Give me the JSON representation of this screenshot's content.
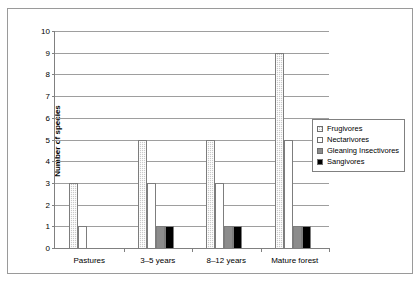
{
  "chart_data": {
    "type": "bar",
    "title": "",
    "xlabel": "",
    "ylabel": "Number of species",
    "ylim": [
      0,
      10
    ],
    "ytick_step": 1,
    "grid": true,
    "legend_position": "right",
    "categories": [
      "Pastures",
      "3–5 years",
      "8–12 years",
      "Mature forest"
    ],
    "yticks": [
      "10",
      "9",
      "8",
      "7",
      "6",
      "5",
      "4",
      "3",
      "2",
      "1",
      "0"
    ],
    "series": [
      {
        "name": "Frugivores",
        "values": [
          3,
          5,
          5,
          9
        ],
        "color": "#c9c9c9",
        "pattern": "hatched"
      },
      {
        "name": "Nectarivores",
        "values": [
          1,
          3,
          3,
          5
        ],
        "color": "#ffffff",
        "pattern": "solid"
      },
      {
        "name": "Gleaning Insectivores",
        "values": [
          0,
          1,
          1,
          1
        ],
        "color": "#8c8c8c",
        "pattern": "solid"
      },
      {
        "name": "Sangivores",
        "values": [
          0,
          1,
          1,
          1
        ],
        "color": "#000000",
        "pattern": "solid"
      }
    ]
  }
}
